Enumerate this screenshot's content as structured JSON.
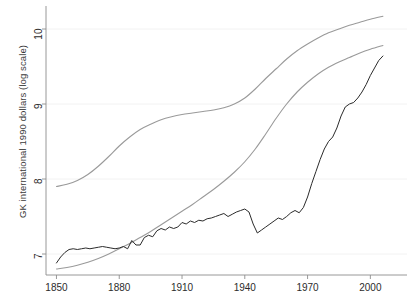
{
  "figure": {
    "background_color": "#ffffff",
    "width": 407,
    "height": 299
  },
  "chart_data": {
    "type": "line",
    "title": "",
    "xlabel": "",
    "ylabel": "GK international 1990 dollars (log scale)",
    "xlim": [
      1845,
      2007
    ],
    "ylim": [
      6.72,
      10.28
    ],
    "grid": true,
    "grid_axis": "y",
    "legend": "none",
    "xticks": [
      1850,
      1880,
      1910,
      1940,
      1970,
      2000
    ],
    "xtick_labels": [
      "1850",
      "1880",
      "1910",
      "1940",
      "1970",
      "2000"
    ],
    "yticks": [
      7,
      8,
      9,
      10
    ],
    "ytick_labels": [
      "7",
      "8",
      "9",
      "10"
    ],
    "series": [
      {
        "name": "upper-smooth-curve",
        "color": "#9a9a9a",
        "width": 1.1,
        "style": "solid",
        "x": [
          1850,
          1855,
          1860,
          1865,
          1870,
          1875,
          1880,
          1885,
          1890,
          1895,
          1900,
          1905,
          1910,
          1915,
          1920,
          1925,
          1930,
          1935,
          1940,
          1945,
          1950,
          1955,
          1960,
          1965,
          1970,
          1975,
          1980,
          1985,
          1990,
          1995,
          2000,
          2006
        ],
        "y": [
          7.9,
          7.93,
          7.98,
          8.06,
          8.17,
          8.3,
          8.44,
          8.56,
          8.66,
          8.73,
          8.79,
          8.83,
          8.86,
          8.88,
          8.9,
          8.92,
          8.95,
          9.0,
          9.08,
          9.2,
          9.34,
          9.47,
          9.6,
          9.71,
          9.8,
          9.88,
          9.95,
          10.0,
          10.05,
          10.09,
          10.13,
          10.17
        ]
      },
      {
        "name": "lower-smooth-curve",
        "color": "#9a9a9a",
        "width": 1.1,
        "style": "solid",
        "x": [
          1850,
          1855,
          1860,
          1865,
          1870,
          1875,
          1880,
          1885,
          1890,
          1895,
          1900,
          1905,
          1910,
          1915,
          1920,
          1925,
          1930,
          1935,
          1940,
          1945,
          1950,
          1955,
          1960,
          1965,
          1970,
          1975,
          1980,
          1985,
          1990,
          1995,
          2000,
          2006
        ],
        "y": [
          6.8,
          6.82,
          6.85,
          6.89,
          6.94,
          7.0,
          7.07,
          7.14,
          7.22,
          7.3,
          7.39,
          7.48,
          7.57,
          7.66,
          7.76,
          7.86,
          7.97,
          8.09,
          8.23,
          8.4,
          8.6,
          8.81,
          9.0,
          9.16,
          9.29,
          9.4,
          9.49,
          9.56,
          9.62,
          9.68,
          9.73,
          9.78
        ]
      },
      {
        "name": "observed-series",
        "color": "#2b2b2b",
        "width": 1.0,
        "style": "solid",
        "x": [
          1850,
          1852,
          1854,
          1856,
          1858,
          1860,
          1862,
          1864,
          1866,
          1868,
          1870,
          1872,
          1874,
          1876,
          1878,
          1880,
          1882,
          1884,
          1886,
          1888,
          1890,
          1892,
          1894,
          1896,
          1898,
          1900,
          1902,
          1904,
          1906,
          1908,
          1910,
          1912,
          1914,
          1916,
          1918,
          1920,
          1922,
          1924,
          1926,
          1928,
          1930,
          1932,
          1934,
          1936,
          1938,
          1940,
          1942,
          1944,
          1946,
          1948,
          1950,
          1952,
          1954,
          1956,
          1958,
          1960,
          1962,
          1964,
          1966,
          1968,
          1970,
          1972,
          1974,
          1976,
          1978,
          1980,
          1982,
          1984,
          1986,
          1988,
          1990,
          1992,
          1994,
          1996,
          1998,
          2000,
          2002,
          2004,
          2006
        ],
        "y": [
          6.88,
          6.96,
          7.02,
          7.06,
          7.07,
          7.06,
          7.07,
          7.08,
          7.07,
          7.08,
          7.09,
          7.1,
          7.09,
          7.08,
          7.07,
          7.08,
          7.1,
          7.07,
          7.18,
          7.12,
          7.12,
          7.22,
          7.25,
          7.23,
          7.31,
          7.34,
          7.32,
          7.36,
          7.34,
          7.36,
          7.42,
          7.4,
          7.44,
          7.42,
          7.45,
          7.44,
          7.47,
          7.48,
          7.5,
          7.52,
          7.54,
          7.5,
          7.53,
          7.56,
          7.58,
          7.6,
          7.56,
          7.4,
          7.28,
          7.32,
          7.36,
          7.4,
          7.44,
          7.48,
          7.46,
          7.5,
          7.55,
          7.58,
          7.55,
          7.62,
          7.76,
          7.94,
          8.1,
          8.26,
          8.4,
          8.5,
          8.56,
          8.68,
          8.84,
          8.96,
          9.0,
          9.02,
          9.08,
          9.16,
          9.26,
          9.38,
          9.48,
          9.58,
          9.64
        ]
      }
    ],
    "annotations": []
  }
}
